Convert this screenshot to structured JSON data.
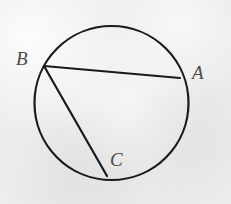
{
  "figure": {
    "background_color": "#eeeeee",
    "stroke_color": "#1a1a1a",
    "label_color": "#4a4a4a",
    "canvas": {
      "width": 231,
      "height": 204
    }
  },
  "circle": {
    "name": "main-circle",
    "center_x": 111.5,
    "center_y": 103,
    "radius": 77,
    "stroke_width": 2.2
  },
  "points": {
    "A": {
      "label": "A",
      "x": 180,
      "y": 78
    },
    "B": {
      "label": "B",
      "x": 44,
      "y": 66
    },
    "C": {
      "label": "C",
      "x": 107,
      "y": 176
    }
  },
  "chords": [
    {
      "name": "chord-BA",
      "from": "B",
      "to": "A",
      "x1": 44,
      "y1": 66,
      "x2": 180,
      "y2": 78,
      "stroke_width": 2.2
    },
    {
      "name": "chord-BC",
      "from": "B",
      "to": "C",
      "x1": 44,
      "y1": 66,
      "x2": 107,
      "y2": 176,
      "stroke_width": 2.2
    }
  ],
  "labels": {
    "A": "A",
    "B": "B",
    "C": "C"
  }
}
